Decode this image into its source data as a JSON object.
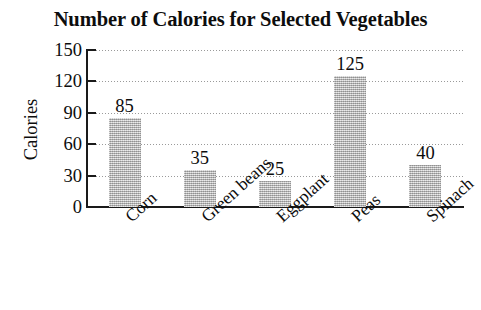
{
  "chart_data": {
    "type": "bar",
    "title": "Number of Calories for Selected Vegetables",
    "xlabel": "",
    "ylabel": "Calories",
    "categories": [
      "Corn",
      "Green beans",
      "Eggplant",
      "Peas",
      "Spinach"
    ],
    "values": [
      85,
      35,
      25,
      125,
      40
    ],
    "value_labels": [
      "85",
      "35",
      "25",
      "125",
      "40"
    ],
    "ylim": [
      0,
      150
    ],
    "yticks": [
      0,
      30,
      60,
      90,
      120,
      150
    ],
    "ytick_labels": [
      "0",
      "30",
      "60",
      "90",
      "120",
      "150"
    ],
    "grid": true,
    "grid_axis": "y",
    "grid_style": "dotted",
    "legend": null,
    "legend_position": "none",
    "bar_color": "#b9b9b9",
    "axis_color": "#1a1a1a",
    "text_color": "#0d0d0d",
    "background_color": "#ffffff",
    "xtick_label_rotation": -42,
    "bar_count": 5
  }
}
